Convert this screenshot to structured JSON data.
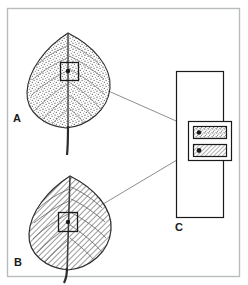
{
  "figure": {
    "type": "scientific-illustration",
    "width": 248,
    "height": 285,
    "background_color": "#ffffff",
    "frame": {
      "name": "figure-border",
      "color": "#b8bcbe",
      "x": 7,
      "y": 8,
      "width": 233,
      "height": 269
    }
  },
  "panels": [
    {
      "id": "A",
      "label": "A",
      "label_x": 13,
      "label_y": 113,
      "subject": "leaf",
      "texture": "stipple",
      "description": "Leaf rendered with fine stippled dot texture showing midrib and lateral veins",
      "inset_box": {
        "name": "detail-box-a",
        "x": 60,
        "y": 62,
        "width": 19,
        "height": 19,
        "stroke_color": "#1a1a1a"
      },
      "marker_dot": {
        "x": 68,
        "y": 71,
        "radius": 2.2,
        "color": "#1a1a1a"
      }
    },
    {
      "id": "B",
      "label": "B",
      "label_x": 14,
      "label_y": 257,
      "subject": "leaf",
      "texture": "diagonal-hatch",
      "description": "Leaf rendered with diagonal line hatching showing midrib and lateral veins",
      "inset_box": {
        "name": "detail-box-b",
        "x": 58,
        "y": 212,
        "width": 20,
        "height": 20,
        "stroke_color": "#1a1a1a"
      },
      "marker_dot": {
        "x": 68,
        "y": 222,
        "radius": 2.2,
        "color": "#1a1a1a"
      }
    },
    {
      "id": "C",
      "label": "C",
      "label_x": 175,
      "label_y": 222,
      "subject": "cross-section-diagram",
      "description": "Tall outer rectangle enclosing a nested detail frame with two stacked sample strips",
      "outer_rect": {
        "name": "panel-c-outer-rect",
        "x": 176,
        "y": 71,
        "width": 48,
        "height": 147,
        "stroke_color": "#1a1a1a"
      },
      "inner_frame": {
        "name": "panel-c-inner-frame",
        "x": 188,
        "y": 121,
        "width": 44,
        "height": 40,
        "stroke_color": "#1a1a1a"
      },
      "strips": [
        {
          "name": "sample-strip-stipple",
          "texture": "stipple",
          "x": 193,
          "y": 126,
          "width": 34,
          "height": 13,
          "stroke_color": "#1a1a1a",
          "dot": {
            "x": 199,
            "y": 132,
            "radius": 2.2,
            "color": "#1a1a1a"
          }
        },
        {
          "name": "sample-strip-hatch",
          "texture": "diagonal-hatch",
          "x": 193,
          "y": 144,
          "width": 34,
          "height": 13,
          "stroke_color": "#1a1a1a",
          "dot": {
            "x": 199,
            "y": 150,
            "radius": 2.4,
            "color": "#1a1a1a"
          }
        }
      ]
    }
  ],
  "leader_lines": [
    {
      "name": "leader-line-a-to-c",
      "from_panel": "A",
      "to_panel": "C",
      "x1": 79,
      "y1": 78,
      "x2": 192,
      "y2": 128,
      "color": "#7d8184"
    },
    {
      "name": "leader-line-b-to-c",
      "from_panel": "B",
      "to_panel": "C",
      "x1": 78,
      "y1": 219,
      "x2": 192,
      "y2": 151,
      "color": "#7d8184"
    }
  ],
  "colors": {
    "ink": "#1a1a1a",
    "leader": "#7d8184",
    "frame": "#b8bcbe",
    "leaf_outline": "#2b2b2b",
    "vein": "#6b6b6b",
    "stipple": "#4a4a4a",
    "hatch": "#7a7a7a"
  }
}
